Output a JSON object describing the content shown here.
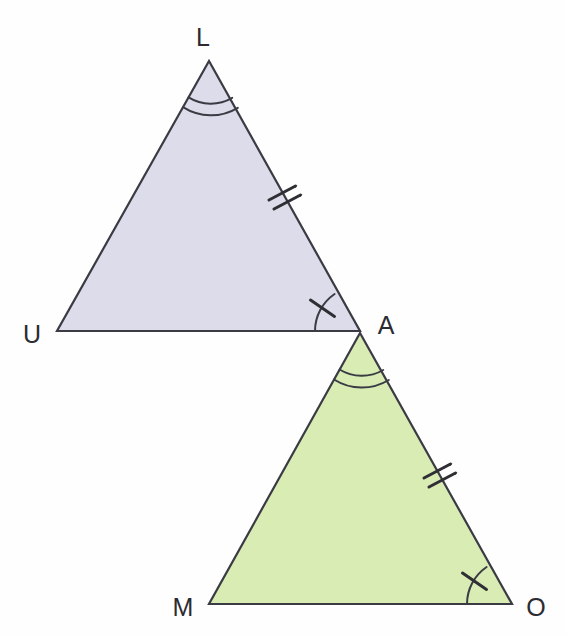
{
  "figure": {
    "background_color": "#fefefe",
    "stroke_color": "#3b3b44",
    "label_color": "#2b2b31"
  },
  "triangles": [
    {
      "name": "triangle-LUA",
      "fill_color": "#dcdcea",
      "vertices": [
        {
          "name": "L",
          "label": "L",
          "x": 209,
          "y": 61,
          "label_x": 203,
          "label_y": 46
        },
        {
          "name": "U",
          "label": "U",
          "x": 57,
          "y": 331,
          "label_x": 32,
          "label_y": 343
        },
        {
          "name": "A",
          "label": "A",
          "x": 360,
          "y": 331,
          "label_x": 386,
          "label_y": 334
        }
      ],
      "angle_marks": [
        {
          "name": "angle-L",
          "at": "L",
          "arcs": 2,
          "ticks": 0
        },
        {
          "name": "angle-A",
          "at": "A",
          "arcs": 1,
          "ticks": 1
        }
      ],
      "side_marks": [
        {
          "name": "side-LA",
          "from": "L",
          "to": "A",
          "ticks": 2
        }
      ]
    },
    {
      "name": "triangle-AMO",
      "fill_color": "#d8ecb4",
      "vertices": [
        {
          "name": "A",
          "label": "A",
          "x": 360,
          "y": 333,
          "label_x": 386,
          "label_y": 334
        },
        {
          "name": "M",
          "label": "M",
          "x": 209,
          "y": 604,
          "label_x": 183,
          "label_y": 616
        },
        {
          "name": "O",
          "label": "O",
          "x": 512,
          "y": 604,
          "label_x": 536,
          "label_y": 616
        }
      ],
      "angle_marks": [
        {
          "name": "angle-A-green",
          "at": "A",
          "arcs": 2,
          "ticks": 0
        },
        {
          "name": "angle-O",
          "at": "O",
          "arcs": 1,
          "ticks": 1
        }
      ],
      "side_marks": [
        {
          "name": "side-AO",
          "from": "A",
          "to": "O",
          "ticks": 2
        }
      ]
    }
  ],
  "labels": {
    "L": "L",
    "U": "U",
    "A": "A",
    "M": "M",
    "O": "O"
  },
  "artifacts": {
    "ghost_line_1": "so that",
    "ghost_line_2": "ange",
    "ghost_line_3": "ngles are",
    "ghost_line_4": "congruent"
  }
}
